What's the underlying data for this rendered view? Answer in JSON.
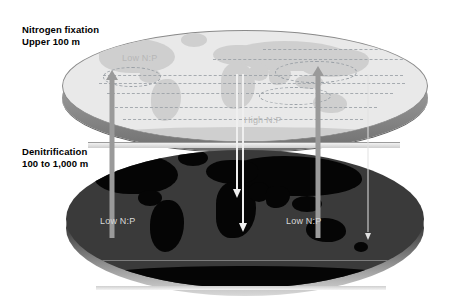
{
  "figure": {
    "type": "diagram",
    "panels": [
      {
        "id": "upper",
        "title": "Nitrogen fixation",
        "depth_range": "Upper 100 m",
        "map_shade": "light",
        "labels": [
          "Low N:P",
          "High N:P"
        ]
      },
      {
        "id": "lower",
        "title": "Denitrification",
        "depth_range": "100 to 1,000 m",
        "map_shade": "dark",
        "labels": [
          "Low N:P",
          "Low N:P"
        ]
      }
    ]
  },
  "callouts": {
    "upper": {
      "line1": "Nitrogen fixation",
      "line2": "Upper 100 m"
    },
    "lower": {
      "line1": "Denitrification",
      "line2": "100 to 1,000 m"
    }
  },
  "map_labels": {
    "upper_low": "Low N:P",
    "upper_high": "High N:P",
    "lower_left_low": "Low N:P",
    "lower_right_low": "Low N:P"
  },
  "arrows": {
    "upward": [
      {
        "name": "arabian-sea-upwelling",
        "direction": "up",
        "color": "#9a9a9a"
      },
      {
        "name": "eastern-tropical-pacific-upwelling",
        "direction": "up",
        "color": "#9a9a9a"
      }
    ],
    "downward": [
      {
        "name": "export-flux-central-pacific-a",
        "direction": "down",
        "color": "#efefef"
      },
      {
        "name": "export-flux-central-pacific-b",
        "direction": "down",
        "color": "#efefef"
      },
      {
        "name": "export-flux-atlantic",
        "direction": "down",
        "color": "#e2e2e2"
      }
    ]
  },
  "colors": {
    "background": "#ffffff",
    "upper_ocean": "#e9e9e9",
    "upper_land": "#cfcfcf",
    "lower_ocean": "#3a3a3a",
    "lower_land": "#050505",
    "upward_arrow": "#9a9a9a",
    "downward_arrow": "#efefef",
    "contour": "#9aa0a6",
    "text": "#000000"
  }
}
